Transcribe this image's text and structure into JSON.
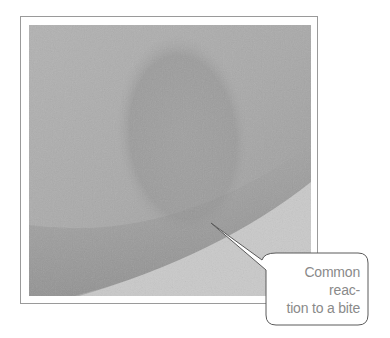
{
  "figure": {
    "callout": {
      "line1": "Common reac-",
      "line2": "tion to a bite"
    },
    "colors": {
      "skin": "#ababab",
      "bite_oval": "#9d9d9d",
      "background_wedge": "#c9c9c9",
      "frame_border": "#9a9a9a",
      "callout_border": "#5a5a5a",
      "callout_text": "#8a8a8a"
    }
  }
}
